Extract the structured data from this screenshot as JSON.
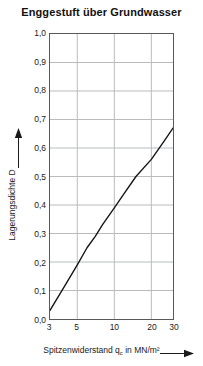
{
  "chart_data": {
    "type": "line",
    "title": "Enggestuft über Grundwasser",
    "xlabel": "Spitzenwiderstand q_c in MN/m²",
    "ylabel": "Lagerungsdichte D",
    "xscale": "log",
    "xlim": [
      3,
      30
    ],
    "ylim": [
      0.0,
      1.0
    ],
    "grid": true,
    "legend": null,
    "x_ticks": [
      3,
      5,
      10,
      20,
      30
    ],
    "x_ticklabels": [
      "3",
      "5",
      "10",
      "20",
      "30"
    ],
    "y_ticks": [
      0.0,
      0.1,
      0.2,
      0.3,
      0.4,
      0.5,
      0.6,
      0.7,
      0.8,
      0.9,
      1.0
    ],
    "y_ticklabels": [
      "0,0",
      "0,1",
      "0,2",
      "0,3",
      "0,4",
      "0,5",
      "0,6",
      "0,7",
      "0,8",
      "0,9",
      "1,0"
    ],
    "series": [
      {
        "name": "Lagerungsdichte",
        "color": "#141414",
        "x": [
          3,
          4,
          5,
          6,
          7,
          8,
          10,
          12,
          15,
          20,
          25,
          30
        ],
        "values": [
          0.03,
          0.12,
          0.19,
          0.25,
          0.29,
          0.33,
          0.39,
          0.44,
          0.5,
          0.56,
          0.62,
          0.67
        ]
      }
    ]
  },
  "axis_arrows": {
    "y_arrow": "up-arrow-icon",
    "x_arrow": "right-arrow-icon"
  },
  "colors": {
    "grid": "#b9bbbd",
    "frame": "#58595b",
    "curve": "#141414",
    "text": "#1a1a1a",
    "background": "#ffffff"
  }
}
